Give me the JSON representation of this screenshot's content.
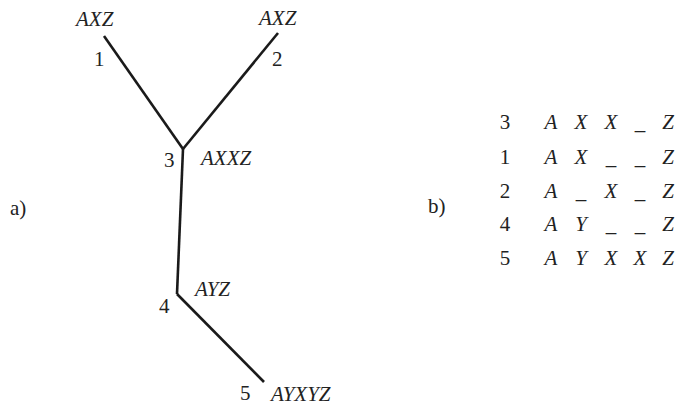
{
  "panel_a": {
    "label": "a)",
    "nodes": [
      {
        "id": "1",
        "sequence": "AXZ"
      },
      {
        "id": "2",
        "sequence": "AXZ"
      },
      {
        "id": "3",
        "sequence": "AXXZ"
      },
      {
        "id": "4",
        "sequence": "AYZ"
      },
      {
        "id": "5",
        "sequence": "AYXYZ"
      }
    ],
    "edges": [
      {
        "from": "1",
        "to": "3"
      },
      {
        "from": "2",
        "to": "3"
      },
      {
        "from": "3",
        "to": "4"
      },
      {
        "from": "4",
        "to": "5"
      }
    ]
  },
  "panel_b": {
    "label": "b)",
    "rows": [
      {
        "id": "3",
        "cells": [
          "A",
          "X",
          "X",
          "_",
          "Z"
        ]
      },
      {
        "id": "1",
        "cells": [
          "A",
          "X",
          "_",
          "_",
          "Z"
        ]
      },
      {
        "id": "2",
        "cells": [
          "A",
          "_",
          "X",
          "_",
          "Z"
        ]
      },
      {
        "id": "4",
        "cells": [
          "A",
          "Y",
          "_",
          "_",
          "Z"
        ]
      },
      {
        "id": "5",
        "cells": [
          "A",
          "Y",
          "X",
          "X",
          "Z"
        ]
      }
    ]
  },
  "colors": {
    "line": "#1a1a1a",
    "text": "#222222",
    "background": "#ffffff"
  }
}
